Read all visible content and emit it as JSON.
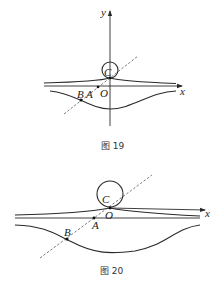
{
  "figures": [
    {
      "caption": "图 19",
      "labels": {
        "y_axis": "y",
        "x_axis": "x",
        "C": "C",
        "O": "O",
        "A": "A",
        "B": "B"
      }
    },
    {
      "caption": "图 20",
      "labels": {
        "x_axis": "x",
        "C": "C",
        "O": "O",
        "A": "A",
        "B": "B"
      }
    }
  ],
  "colors": {
    "stroke": "#2a2a2a",
    "background": "#ffffff"
  }
}
